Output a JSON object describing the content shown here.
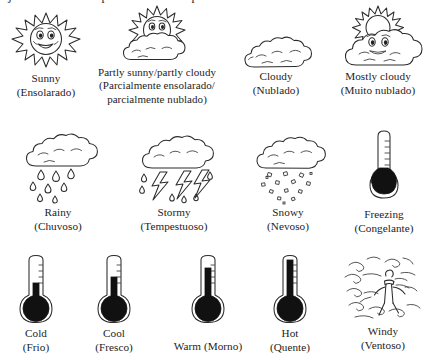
{
  "page": {
    "clipped_heading": "ojeto. As vezes um pais esses e a temperatura esta nublado",
    "background_color": "#ffffff",
    "ink_color": "#2b2b2b"
  },
  "rows": [
    {
      "name": "sky-conditions",
      "items": [
        {
          "icon": "sunny-icon",
          "english": "Sunny",
          "portuguese": "(Ensolarado)"
        },
        {
          "icon": "partly-sunny-icon",
          "english": "Partly sunny/partly cloudy",
          "portuguese": "(Parcialmente ensolarado/\nparcialmente nublado)"
        },
        {
          "icon": "cloudy-icon",
          "english": "Cloudy",
          "portuguese": "(Nublado)"
        },
        {
          "icon": "mostly-cloudy-icon",
          "english": "Mostly cloudy",
          "portuguese": "(Muito nublado)"
        }
      ]
    },
    {
      "name": "precipitation-conditions",
      "items": [
        {
          "icon": "rainy-icon",
          "english": "Rainy",
          "portuguese": "(Chuvoso)"
        },
        {
          "icon": "stormy-icon",
          "english": "Stormy",
          "portuguese": "(Tempestuoso)"
        },
        {
          "icon": "snowy-icon",
          "english": "Snowy",
          "portuguese": "(Nevoso)"
        },
        {
          "icon": "freezing-thermometer-icon",
          "english": "Freezing",
          "portuguese": "(Congelante)"
        }
      ]
    },
    {
      "name": "temperature-conditions",
      "items": [
        {
          "icon": "cold-thermometer-icon",
          "english": "Cold",
          "portuguese": "(Frio)",
          "mercury_level": 0.18
        },
        {
          "icon": "cool-thermometer-icon",
          "english": "Cool",
          "portuguese": "(Fresco)",
          "mercury_level": 0.34
        },
        {
          "icon": "warm-thermometer-icon",
          "english": "Warm (Morno)",
          "portuguese": "",
          "mercury_level": 0.58
        },
        {
          "icon": "hot-thermometer-icon",
          "english": "Hot",
          "portuguese": "(Quente)",
          "mercury_level": 0.86
        },
        {
          "icon": "windy-icon",
          "english": "Windy",
          "portuguese": "(Ventoso)"
        }
      ]
    }
  ]
}
